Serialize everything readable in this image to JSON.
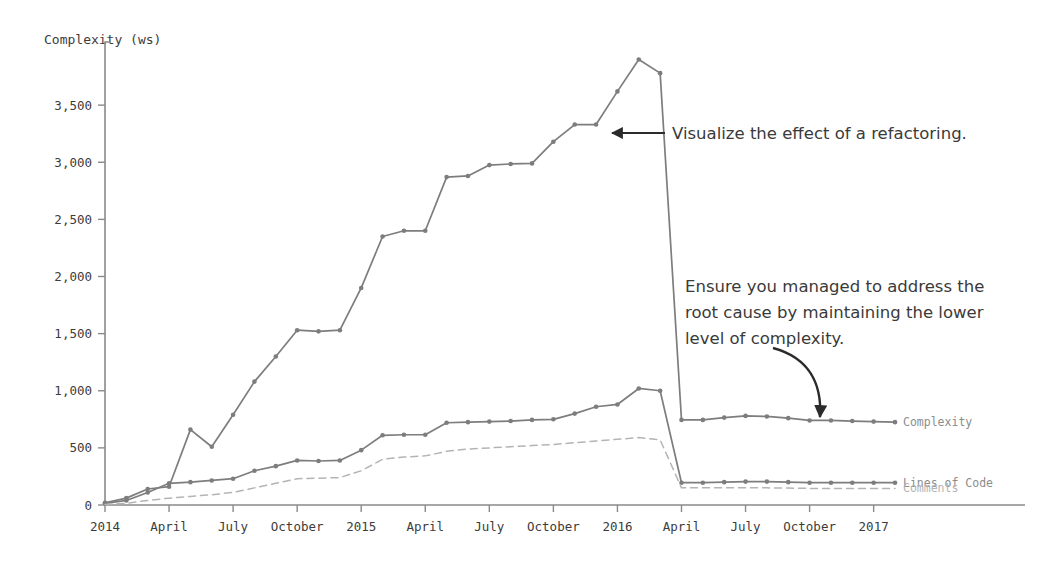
{
  "chart_data": {
    "type": "line",
    "title": "",
    "ylabel": "Complexity (ws)",
    "xlabel": "",
    "ylim": [
      0,
      4000
    ],
    "yticks": [
      0,
      500,
      1000,
      1500,
      2000,
      2500,
      3000,
      3500
    ],
    "ytick_labels": [
      "0",
      "500",
      "1,000",
      "1,500",
      "2,000",
      "2,500",
      "3,000",
      "3,500"
    ],
    "grid": false,
    "legend_position": "right-inline",
    "x_tick_labels": [
      "2014",
      "April",
      "July",
      "October",
      "2015",
      "April",
      "July",
      "October",
      "2016",
      "April",
      "July",
      "October",
      "2017"
    ],
    "x_tick_indices": [
      0,
      3,
      6,
      9,
      12,
      15,
      18,
      21,
      24,
      27,
      30,
      33,
      36
    ],
    "x_count": 38,
    "series": [
      {
        "name": "Complexity",
        "color": "#7d7d7d",
        "dash": "none",
        "label_color": "#8c8c8c",
        "values": [
          20,
          60,
          140,
          160,
          660,
          510,
          790,
          1080,
          1300,
          1530,
          1520,
          1530,
          1900,
          2350,
          2400,
          2400,
          2870,
          2880,
          2975,
          2985,
          2990,
          3180,
          3330,
          3330,
          3620,
          3900,
          3780,
          745,
          745,
          765,
          780,
          775,
          760,
          740,
          740,
          735,
          730,
          725
        ]
      },
      {
        "name": "Lines of Code",
        "color": "#7d7d7d",
        "dash": "none",
        "label_color": "#8c8c8c",
        "values": [
          15,
          40,
          110,
          190,
          200,
          215,
          230,
          300,
          340,
          390,
          385,
          390,
          480,
          610,
          615,
          615,
          720,
          725,
          730,
          735,
          745,
          750,
          800,
          860,
          880,
          1020,
          1000,
          195,
          195,
          200,
          205,
          205,
          200,
          195,
          195,
          195,
          195,
          195
        ]
      },
      {
        "name": "Comments",
        "color": "#b4b4b4",
        "dash": "dashed",
        "label_color": "#b4b4b4",
        "values": [
          5,
          15,
          40,
          60,
          75,
          90,
          110,
          150,
          190,
          230,
          235,
          240,
          300,
          400,
          420,
          430,
          470,
          490,
          500,
          510,
          520,
          530,
          545,
          560,
          575,
          590,
          570,
          150,
          150,
          150,
          150,
          150,
          148,
          145,
          145,
          145,
          145,
          145
        ]
      }
    ],
    "annotations": [
      {
        "id": "refactoring-note",
        "text_lines": [
          "Visualize the effect of a refactoring."
        ],
        "x": 672,
        "y": 133,
        "arrow": "straight-left"
      },
      {
        "id": "root-cause-note",
        "text_lines": [
          "Ensure you managed to address the",
          "root cause by maintaining the lower",
          "level of complexity."
        ],
        "x": 685,
        "y": 292,
        "arrow": "curved-down-right"
      }
    ]
  }
}
